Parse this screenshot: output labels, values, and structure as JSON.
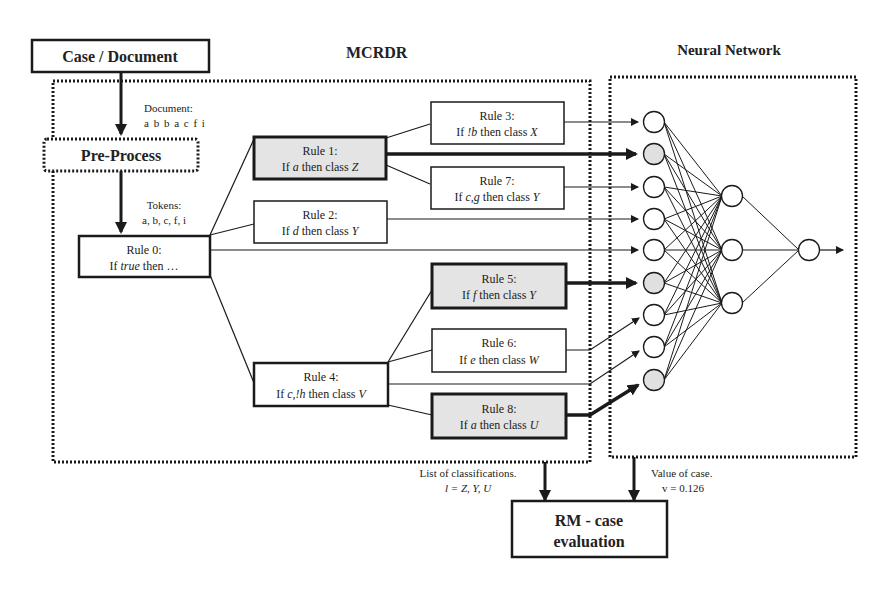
{
  "titles": {
    "mcrdr": "MCRDR",
    "neural_network": "Neural Network"
  },
  "case_document": {
    "label": "Case / Document"
  },
  "pre_process": {
    "label": "Pre-Process"
  },
  "document_note": {
    "line1": "Document:",
    "line2": "a b b a c f i"
  },
  "tokens_note": {
    "line1": "Tokens:",
    "line2": "a, b, c, f, i"
  },
  "rules": [
    {
      "id": "rule0",
      "title": "Rule 0:",
      "pre": "If ",
      "cond": "true",
      "post": " then …",
      "cls": "",
      "highlighted": false
    },
    {
      "id": "rule1",
      "title": "Rule 1:",
      "pre": "If ",
      "cond": "a",
      "post": " then class ",
      "cls": "Z",
      "highlighted": true
    },
    {
      "id": "rule2",
      "title": "Rule 2:",
      "pre": "If ",
      "cond": "d",
      "post": " then class ",
      "cls": "Y",
      "highlighted": false
    },
    {
      "id": "rule3",
      "title": "Rule 3:",
      "pre": "If ",
      "cond": "!b",
      "post": " then class ",
      "cls": "X",
      "highlighted": false
    },
    {
      "id": "rule4",
      "title": "Rule 4:",
      "pre": "If ",
      "cond": "c,!h",
      "post": " then class ",
      "cls": "V",
      "highlighted": false
    },
    {
      "id": "rule5",
      "title": "Rule 5:",
      "pre": "If ",
      "cond": "f",
      "post": " then class ",
      "cls": "Y",
      "highlighted": true
    },
    {
      "id": "rule6",
      "title": "Rule 6:",
      "pre": "If ",
      "cond": "e",
      "post": " then class ",
      "cls": "W",
      "highlighted": false
    },
    {
      "id": "rule7",
      "title": "Rule 7:",
      "pre": "If ",
      "cond": "c,g",
      "post": " then class ",
      "cls": "Y",
      "highlighted": false
    },
    {
      "id": "rule8",
      "title": "Rule 8:",
      "pre": "If ",
      "cond": "a",
      "post": " then class ",
      "cls": "U",
      "highlighted": true
    }
  ],
  "neural_net": {
    "input_nodes": 9,
    "active_inputs": [
      1,
      5,
      8
    ],
    "hidden_nodes": 3,
    "output_nodes": 1
  },
  "classifications_note": {
    "line1": "List of classifications.",
    "line2": "l = Z, Y, U"
  },
  "value_note": {
    "line1": "Value of case.",
    "line2": "v = 0.126"
  },
  "rm_case_evaluation": {
    "line1": "RM - case",
    "line2": "evaluation"
  },
  "colors": {
    "highlight_fill": "#e4e4e4",
    "stroke": "#1a1a1a",
    "background": "#ffffff"
  }
}
